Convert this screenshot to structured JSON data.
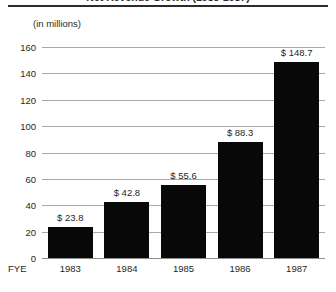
{
  "header": {
    "clipped_title": "Net Revenue Growth (1983-1987)",
    "subtitle": "(in millions)"
  },
  "axis": {
    "x_axis_label": "FYE"
  },
  "style": {
    "bar_color": "#080808",
    "gridline_color": "#a9a9a9",
    "background": "#ffffff",
    "text_color": "#1f1f1f"
  },
  "chart_data": {
    "type": "bar",
    "title": "Net Revenue Growth (1983-1987)",
    "subtitle": "(in millions)",
    "xlabel": "FYE",
    "ylabel": "",
    "categories": [
      "1983",
      "1984",
      "1985",
      "1986",
      "1987"
    ],
    "values": [
      23.8,
      42.8,
      55.6,
      88.3,
      148.7
    ],
    "value_labels": [
      "$ 23.8",
      "$ 42.8",
      "$ 55.6",
      "$ 88.3",
      "$ 148.7"
    ],
    "ylim": [
      0,
      160
    ],
    "yticks": [
      0,
      20,
      40,
      60,
      80,
      100,
      120,
      140,
      160
    ],
    "ytick_labels": [
      "0",
      "20",
      "40",
      "60",
      "80",
      "100",
      "120",
      "140",
      "160"
    ],
    "grid": true,
    "grid_axis": "y",
    "legend": false,
    "legend_position": "none"
  }
}
